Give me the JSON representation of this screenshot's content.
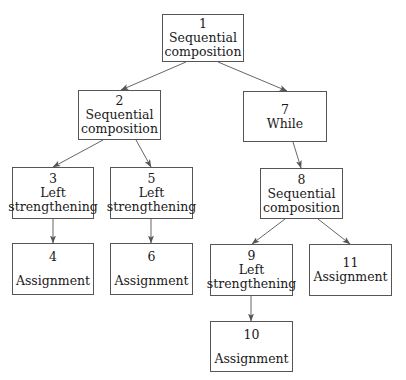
{
  "diagram": {
    "type": "tree",
    "colors": {
      "box_border": "#555555",
      "edge": "#555555",
      "background": "#ffffff",
      "text": "#1a1a1a"
    },
    "nodes": [
      {
        "id": "1",
        "number": "1",
        "label": "Sequential\ncomposition",
        "x": 162,
        "y": 14,
        "w": 82,
        "h": 48,
        "spaced": false
      },
      {
        "id": "2",
        "number": "2",
        "label": "Sequential\ncomposition",
        "x": 78,
        "y": 90,
        "w": 83,
        "h": 50,
        "spaced": false
      },
      {
        "id": "3",
        "number": "3",
        "label": "Left\nstrengthening",
        "x": 12,
        "y": 167,
        "w": 82,
        "h": 52,
        "spaced": false
      },
      {
        "id": "4",
        "number": "4",
        "label": "Assignment",
        "x": 12,
        "y": 243,
        "w": 82,
        "h": 52,
        "spaced": true
      },
      {
        "id": "5",
        "number": "5",
        "label": "Left\nstrengthening",
        "x": 110,
        "y": 167,
        "w": 83,
        "h": 52,
        "spaced": false
      },
      {
        "id": "6",
        "number": "6",
        "label": "Assignment",
        "x": 110,
        "y": 243,
        "w": 83,
        "h": 52,
        "spaced": true
      },
      {
        "id": "7",
        "number": "7",
        "label": "While",
        "x": 243,
        "y": 91,
        "w": 84,
        "h": 51,
        "spaced": false
      },
      {
        "id": "8",
        "number": "8",
        "label": "Sequential\ncomposition",
        "x": 260,
        "y": 168,
        "w": 83,
        "h": 51,
        "spaced": false
      },
      {
        "id": "9",
        "number": "9",
        "label": "Left\nstrengthening",
        "x": 210,
        "y": 244,
        "w": 83,
        "h": 52,
        "spaced": false
      },
      {
        "id": "10",
        "number": "10",
        "label": "Assignment",
        "x": 210,
        "y": 321,
        "w": 83,
        "h": 51,
        "spaced": true
      },
      {
        "id": "11",
        "number": "11",
        "label": "Assignment",
        "x": 309,
        "y": 244,
        "w": 83,
        "h": 52,
        "spaced": false
      }
    ],
    "edges": [
      {
        "from": "1",
        "to": "2",
        "x1": 186,
        "y1": 62,
        "x2": 121,
        "y2": 90
      },
      {
        "from": "1",
        "to": "7",
        "x1": 218,
        "y1": 62,
        "x2": 287,
        "y2": 91
      },
      {
        "from": "2",
        "to": "3",
        "x1": 103,
        "y1": 140,
        "x2": 53,
        "y2": 167
      },
      {
        "from": "2",
        "to": "5",
        "x1": 136,
        "y1": 140,
        "x2": 151,
        "y2": 167
      },
      {
        "from": "3",
        "to": "4",
        "x1": 53,
        "y1": 219,
        "x2": 53,
        "y2": 243
      },
      {
        "from": "5",
        "to": "6",
        "x1": 151,
        "y1": 219,
        "x2": 151,
        "y2": 243
      },
      {
        "from": "7",
        "to": "8",
        "x1": 293,
        "y1": 142,
        "x2": 301,
        "y2": 168
      },
      {
        "from": "8",
        "to": "9",
        "x1": 285,
        "y1": 219,
        "x2": 252,
        "y2": 244
      },
      {
        "from": "8",
        "to": "11",
        "x1": 318,
        "y1": 219,
        "x2": 350,
        "y2": 244
      },
      {
        "from": "9",
        "to": "10",
        "x1": 251,
        "y1": 296,
        "x2": 251,
        "y2": 321
      }
    ]
  }
}
